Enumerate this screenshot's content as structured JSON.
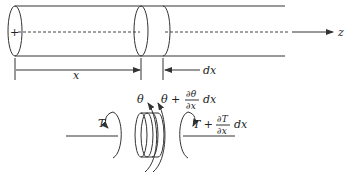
{
  "figure": {
    "axis_label": "z",
    "position_label": "x",
    "element_length_label": "dx",
    "origin_marker": "+",
    "element": {
      "angle_left": "θ",
      "angle_right_base": "θ +",
      "angle_right_num": "∂θ",
      "angle_right_den": "∂x",
      "angle_right_tail": "dx",
      "torque_left": "T",
      "torque_right_base": "T +",
      "torque_right_num": "∂T",
      "torque_right_den": "∂x",
      "torque_right_tail": "dx"
    }
  }
}
